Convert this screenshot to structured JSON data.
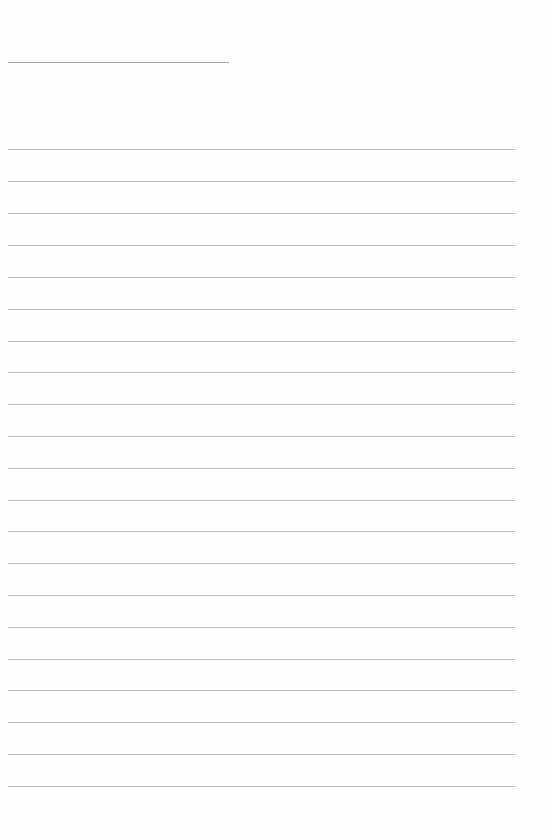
{
  "document": {
    "type": "lined-paper",
    "title_line": {
      "label": "",
      "value": ""
    },
    "rules": [
      {
        "y": 149,
        "text": ""
      },
      {
        "y": 181,
        "text": ""
      },
      {
        "y": 213,
        "text": ""
      },
      {
        "y": 245,
        "text": ""
      },
      {
        "y": 277,
        "text": ""
      },
      {
        "y": 309,
        "text": ""
      },
      {
        "y": 341,
        "text": ""
      },
      {
        "y": 372,
        "text": ""
      },
      {
        "y": 404,
        "text": ""
      },
      {
        "y": 436,
        "text": ""
      },
      {
        "y": 468,
        "text": ""
      },
      {
        "y": 500,
        "text": ""
      },
      {
        "y": 531,
        "text": ""
      },
      {
        "y": 563,
        "text": ""
      },
      {
        "y": 595,
        "text": ""
      },
      {
        "y": 627,
        "text": ""
      },
      {
        "y": 659,
        "text": ""
      },
      {
        "y": 690,
        "text": ""
      },
      {
        "y": 722,
        "text": ""
      },
      {
        "y": 754,
        "text": ""
      },
      {
        "y": 786,
        "text": ""
      }
    ],
    "colors": {
      "paper": "#fefefe",
      "title_line": "#a9a9a9",
      "rule": "#bdbdbd"
    }
  }
}
